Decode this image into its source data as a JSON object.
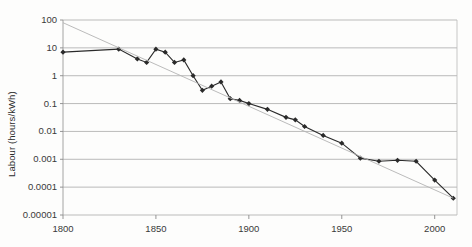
{
  "chart_data": {
    "type": "line",
    "title": "",
    "xlabel": "",
    "ylabel": "Labour (hours/kWh)",
    "xlim": [
      1800,
      2012
    ],
    "ylim": [
      1e-05,
      100
    ],
    "yscale": "log",
    "grid": true,
    "legend": "none",
    "xticks": [
      "1800",
      "1850",
      "1900",
      "1950",
      "2000"
    ],
    "xtick_values": [
      1800,
      1850,
      1900,
      1950,
      2000
    ],
    "yticks": [
      "100",
      "10",
      "1",
      "0.1",
      "0.01",
      "0.001",
      "0.0001",
      "0.00001"
    ],
    "ytick_values": [
      100,
      10,
      1,
      0.1,
      0.01,
      0.001,
      0.0001,
      1e-05
    ],
    "series": [
      {
        "name": "Labour required per kWh",
        "marker": "diamond",
        "color": "#2a2a2a",
        "x": [
          1800,
          1830,
          1840,
          1845,
          1850,
          1855,
          1860,
          1865,
          1870,
          1875,
          1880,
          1885,
          1890,
          1895,
          1900,
          1910,
          1920,
          1925,
          1930,
          1940,
          1950,
          1960,
          1970,
          1980,
          1990,
          2000,
          2010
        ],
        "y": [
          7,
          9,
          4,
          3,
          9,
          7,
          3,
          3.7,
          1,
          0.3,
          0.42,
          0.6,
          0.15,
          0.13,
          0.1,
          0.062,
          0.032,
          0.026,
          0.015,
          0.0072,
          0.0038,
          0.0011,
          0.00085,
          0.00092,
          0.00085,
          0.00018,
          4e-05
        ]
      },
      {
        "name": "Trend",
        "marker": "none",
        "color": "#b3b3b3",
        "x": [
          1800,
          2010
        ],
        "y": [
          80,
          4e-05
        ]
      }
    ]
  },
  "axes": {
    "ylabel_text": "Labour (hours/kWh)"
  }
}
